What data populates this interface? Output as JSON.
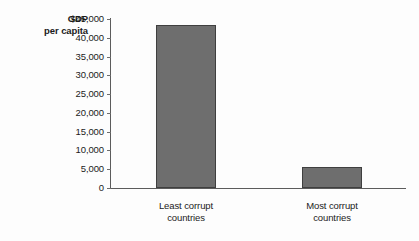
{
  "chart_data": {
    "type": "bar",
    "title": "",
    "xlabel": "",
    "ylabel": "GDP per capita",
    "ylabel_line1": "GDP",
    "ylabel_line2": "per capita",
    "categories": [
      "Least corrupt countries",
      "Most corrupt countries"
    ],
    "category_lines": [
      [
        "Least corrupt",
        "countries"
      ],
      [
        "Most corrupt",
        "countries"
      ]
    ],
    "values": [
      43500,
      5600
    ],
    "ylim": [
      0,
      45000
    ],
    "ytick_values": [
      45000,
      40000,
      35000,
      30000,
      25000,
      20000,
      15000,
      10000,
      5000,
      0
    ],
    "ytick_labels": [
      "$45,000",
      "40,000",
      "35,000",
      "30,000",
      "25,000",
      "20,000",
      "15,000",
      "10,000",
      "5,000",
      "0"
    ],
    "grid": false,
    "legend": false,
    "bar_color": "#6e6e6e",
    "bar_outline_color": "#3f3f3f",
    "axis_color": "#5c5c5c"
  }
}
